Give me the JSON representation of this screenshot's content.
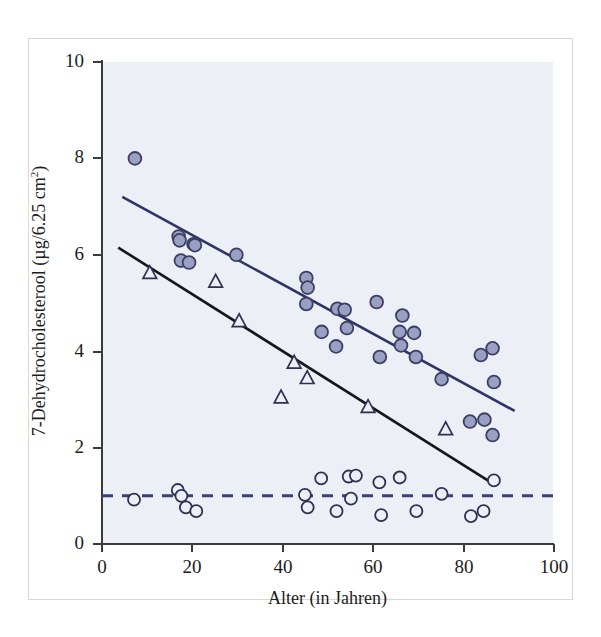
{
  "chart_data": {
    "type": "scatter",
    "title": "",
    "xlabel": "Alter (in Jahren)",
    "ylabel": "7-Dehydrocholesterool (µg/6.25 cm²)",
    "ylabel_main": "7-Dehydrocholesterool (µg/6.25 cm",
    "ylabel_sup": "2",
    "ylabel_tail": ")",
    "xlim": [
      0,
      100
    ],
    "ylim": [
      0,
      10
    ],
    "xticks": [
      0,
      20,
      40,
      60,
      80,
      100
    ],
    "yticks": [
      0,
      2,
      4,
      6,
      8,
      10
    ],
    "xtick_labels": [
      "0",
      "20",
      "40",
      "60",
      "80",
      "100"
    ],
    "ytick_labels": [
      "0",
      "2",
      "4",
      "6",
      "8",
      "10"
    ],
    "grid": false,
    "legend": "none",
    "plot_background": "#eceff5",
    "colors": {
      "filled_circle_fill": "#9aa0c4",
      "filled_circle_edge": "#3c3f63",
      "open_marker_edge": "#2e3150",
      "trendline_upper": "#2f3466",
      "trendline_lower": "#15151a",
      "dashed_reference": "#3a3f78",
      "axis": "#3a3a42",
      "text": "#1c1c22",
      "frame": "#d8d8d8"
    },
    "series": [
      {
        "name": "filled-circles",
        "marker": "circle-filled",
        "points": [
          [
            7.3,
            8.0
          ],
          [
            17.0,
            6.38
          ],
          [
            17.2,
            6.3
          ],
          [
            17.5,
            5.88
          ],
          [
            19.3,
            5.84
          ],
          [
            20.3,
            6.22
          ],
          [
            20.6,
            6.2
          ],
          [
            29.8,
            6.0
          ],
          [
            45.3,
            5.52
          ],
          [
            45.6,
            5.32
          ],
          [
            45.3,
            4.98
          ],
          [
            48.7,
            4.4
          ],
          [
            51.9,
            4.1
          ],
          [
            52.2,
            4.88
          ],
          [
            53.8,
            4.86
          ],
          [
            54.3,
            4.48
          ],
          [
            60.9,
            5.02
          ],
          [
            61.6,
            3.88
          ],
          [
            66.0,
            4.4
          ],
          [
            66.3,
            4.12
          ],
          [
            66.6,
            4.74
          ],
          [
            69.2,
            4.38
          ],
          [
            69.6,
            3.88
          ],
          [
            75.3,
            3.42
          ],
          [
            81.6,
            2.54
          ],
          [
            84.0,
            3.92
          ],
          [
            84.8,
            2.58
          ],
          [
            86.6,
            4.06
          ],
          [
            86.9,
            3.36
          ],
          [
            86.6,
            2.26
          ]
        ]
      },
      {
        "name": "open-triangles",
        "marker": "triangle-open",
        "points": [
          [
            10.6,
            5.62
          ],
          [
            25.2,
            5.44
          ],
          [
            30.4,
            4.62
          ],
          [
            39.7,
            3.04
          ],
          [
            42.6,
            3.76
          ],
          [
            45.5,
            3.44
          ],
          [
            59.0,
            2.84
          ],
          [
            76.2,
            2.38
          ]
        ]
      },
      {
        "name": "open-circles",
        "marker": "circle-open",
        "points": [
          [
            7.1,
            0.92
          ],
          [
            16.8,
            1.12
          ],
          [
            17.6,
            1.0
          ],
          [
            18.6,
            0.76
          ],
          [
            20.9,
            0.68
          ],
          [
            45.0,
            1.02
          ],
          [
            45.6,
            0.76
          ],
          [
            48.6,
            1.36
          ],
          [
            52.0,
            0.68
          ],
          [
            54.7,
            1.4
          ],
          [
            55.2,
            0.94
          ],
          [
            56.3,
            1.42
          ],
          [
            61.5,
            1.28
          ],
          [
            61.9,
            0.6
          ],
          [
            66.0,
            1.38
          ],
          [
            69.7,
            0.68
          ],
          [
            75.3,
            1.04
          ],
          [
            81.8,
            0.58
          ],
          [
            84.6,
            0.68
          ],
          [
            86.9,
            1.32
          ]
        ]
      }
    ],
    "fitlines": [
      {
        "name": "upper-regression-line",
        "style": "solid",
        "color": "#2f3466",
        "x1": 4.5,
        "y1": 7.2,
        "x2": 91.5,
        "y2": 2.76
      },
      {
        "name": "lower-regression-line",
        "style": "solid",
        "color": "#15151a",
        "x1": 3.6,
        "y1": 6.15,
        "x2": 87.2,
        "y2": 1.22
      },
      {
        "name": "dashed-reference-line",
        "style": "dashed",
        "color": "#3a3f78",
        "x1": 0.0,
        "y1": 1.0,
        "x2": 100.0,
        "y2": 1.0
      }
    ]
  }
}
